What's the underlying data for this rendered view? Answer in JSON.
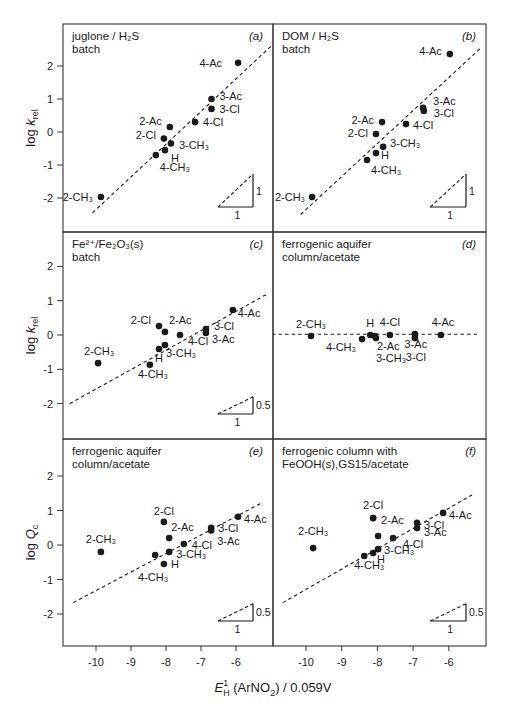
{
  "figure": {
    "x_axis_label": {
      "main": "E",
      "sup": "1",
      "sub": "H",
      "rest": " (ArNO",
      "sub2": "2",
      "tail": ") / 0.059V"
    },
    "x_ticks": [
      -10,
      -9,
      -8,
      -7,
      -6
    ],
    "y_ticks": [
      2,
      1,
      0,
      -1,
      -2
    ],
    "colors": {
      "ink": "#1a1a1a",
      "frame": "#333333",
      "background": "#ffffff"
    }
  },
  "chart_data": [
    {
      "id": "a",
      "panel_tag": "(a)",
      "type": "scatter",
      "title_lines": [
        "juglone / H₂S",
        "batch"
      ],
      "ylabel": "log k_rel",
      "xlabel": "",
      "xlim": [
        -10.95,
        -5.15
      ],
      "ylim": [
        -2.75,
        2.75
      ],
      "fit_line": {
        "x1": -10.1,
        "y1": -2.45,
        "x2": -5.0,
        "y2": 2.6
      },
      "slope_triangle": {
        "run": "1",
        "rise": "1"
      },
      "points": [
        {
          "label": "4-Ac",
          "x": -5.94,
          "y": 2.1,
          "lx": -14,
          "ly": 4,
          "anchor": "end"
        },
        {
          "label": "3-Ac",
          "x": -6.7,
          "y": 1.0,
          "lx": 6,
          "ly": 1,
          "anchor": "start"
        },
        {
          "label": "3-Cl",
          "x": -6.7,
          "y": 0.7,
          "lx": 6,
          "ly": 4,
          "anchor": "start"
        },
        {
          "label": "4-Cl",
          "x": -7.17,
          "y": 0.3,
          "lx": 6,
          "ly": 4,
          "anchor": "start"
        },
        {
          "label": "2-Ac",
          "x": -7.89,
          "y": 0.15,
          "lx": -6,
          "ly": -2,
          "anchor": "end"
        },
        {
          "label": "2-Cl",
          "x": -8.06,
          "y": -0.2,
          "lx": -6,
          "ly": 0,
          "anchor": "end"
        },
        {
          "label": "3-CH₃",
          "x": -7.86,
          "y": -0.35,
          "lx": 6,
          "ly": 5,
          "anchor": "start"
        },
        {
          "label": "H",
          "x": -8.03,
          "y": -0.55,
          "lx": 4,
          "ly": 12,
          "anchor": "start"
        },
        {
          "label": "4-CH₃",
          "x": -8.29,
          "y": -0.7,
          "lx": 2,
          "ly": 16,
          "anchor": "start"
        },
        {
          "label": "2-CH₃",
          "x": -9.86,
          "y": -1.97,
          "lx": -6,
          "ly": 4,
          "anchor": "end"
        }
      ]
    },
    {
      "id": "b",
      "panel_tag": "(b)",
      "type": "scatter",
      "title_lines": [
        "DOM / H₂S",
        "batch"
      ],
      "ylabel": "",
      "xlabel": "",
      "xlim": [
        -10.95,
        -5.15
      ],
      "ylim": [
        -2.75,
        2.75
      ],
      "fit_line": {
        "x1": -10.15,
        "y1": -2.5,
        "x2": -5.1,
        "y2": 2.55
      },
      "slope_triangle": {
        "run": "1",
        "rise": "1"
      },
      "points": [
        {
          "label": "4-Ac",
          "x": -5.97,
          "y": 2.36,
          "lx": -6,
          "ly": 1,
          "anchor": "end"
        },
        {
          "label": "3-Ac",
          "x": -6.72,
          "y": 0.73,
          "lx": 8,
          "ly": -3,
          "anchor": "start"
        },
        {
          "label": "3-Cl",
          "x": -6.7,
          "y": 0.64,
          "lx": 8,
          "ly": 6,
          "anchor": "start"
        },
        {
          "label": "4-Cl",
          "x": -7.2,
          "y": 0.24,
          "lx": 5,
          "ly": 5,
          "anchor": "start"
        },
        {
          "label": "2-Ac",
          "x": -7.87,
          "y": 0.3,
          "lx": -6,
          "ly": 2,
          "anchor": "end"
        },
        {
          "label": "2-Cl",
          "x": -8.04,
          "y": -0.06,
          "lx": -6,
          "ly": 3,
          "anchor": "end"
        },
        {
          "label": "3-CH₃",
          "x": -7.84,
          "y": -0.45,
          "lx": 5,
          "ly": 0,
          "anchor": "start"
        },
        {
          "label": "H",
          "x": -8.04,
          "y": -0.64,
          "lx": 3,
          "ly": 6,
          "anchor": "start"
        },
        {
          "label": "4-CH₃",
          "x": -8.29,
          "y": -0.85,
          "lx": 2,
          "ly": 14,
          "anchor": "start"
        },
        {
          "label": "2-CH₃",
          "x": -9.83,
          "y": -1.97,
          "lx": -5,
          "ly": 4,
          "anchor": "end"
        }
      ]
    },
    {
      "id": "c",
      "panel_tag": "(c)",
      "type": "scatter",
      "title_lines": [
        "Fe²⁺/Fe₂O₃(s)",
        "batch"
      ],
      "ylabel": "log k_rel",
      "xlabel": "",
      "xlim": [
        -10.95,
        -5.15
      ],
      "ylim": [
        -3.0,
        2.95
      ],
      "fit_line": {
        "x1": -10.75,
        "y1": -2.0,
        "x2": -5.1,
        "y2": 1.2
      },
      "slope_triangle": {
        "run": "1",
        "rise": "0.5"
      },
      "points": [
        {
          "label": "4-Ac",
          "x": -6.09,
          "y": 0.73,
          "lx": 3,
          "ly": 7,
          "anchor": "start"
        },
        {
          "label": "3-Cl",
          "x": -6.86,
          "y": 0.17,
          "lx": 6,
          "ly": 1,
          "anchor": "start"
        },
        {
          "label": "3-Ac",
          "x": -6.86,
          "y": 0.06,
          "lx": 4,
          "ly": 10,
          "anchor": "start"
        },
        {
          "label": "4-Cl",
          "x": -7.6,
          "y": 0.0,
          "lx": 6,
          "ly": 10,
          "anchor": "start"
        },
        {
          "label": "2-Ac",
          "x": -8.03,
          "y": 0.09,
          "lx": 2,
          "ly": -8,
          "anchor": "start"
        },
        {
          "label": "2-Cl",
          "x": -8.2,
          "y": 0.26,
          "lx": -6,
          "ly": -2,
          "anchor": "end"
        },
        {
          "label": "3-CH₃",
          "x": -8.03,
          "y": -0.29,
          "lx": -1,
          "ly": 12,
          "anchor": "start"
        },
        {
          "label": "H",
          "x": -8.2,
          "y": -0.41,
          "lx": 0,
          "ly": 13,
          "anchor": "middle"
        },
        {
          "label": "4-CH₃",
          "x": -8.46,
          "y": -0.87,
          "lx": -14,
          "ly": 13,
          "anchor": "start"
        },
        {
          "label": "2-CH₃",
          "x": -9.94,
          "y": -0.82,
          "lx": -16,
          "ly": -8,
          "anchor": "start"
        }
      ]
    },
    {
      "id": "d",
      "panel_tag": "(d)",
      "type": "scatter",
      "title_lines": [
        "ferrogenic aquifer",
        "column/acetate"
      ],
      "ylabel": "",
      "xlabel": "",
      "xlim": [
        -10.95,
        -5.15
      ],
      "ylim": [
        -3.0,
        2.95
      ],
      "fit_line": {
        "x1": -10.95,
        "y1": 0.02,
        "x2": -5.15,
        "y2": 0.02
      },
      "slope_triangle": null,
      "points": [
        {
          "label": "2-CH₃",
          "x": -9.86,
          "y": -0.03,
          "lx": 0,
          "ly": -8,
          "anchor": "middle"
        },
        {
          "label": "4-CH₃",
          "x": -8.43,
          "y": -0.12,
          "lx": -4,
          "ly": 12,
          "anchor": "end"
        },
        {
          "label": "H",
          "x": -8.2,
          "y": 0.0,
          "lx": 0,
          "ly": -8,
          "anchor": "middle"
        },
        {
          "label": "2-Ac",
          "x": -8.07,
          "y": -0.03,
          "lx": 0,
          "ly": 14,
          "anchor": "start"
        },
        {
          "label": "3-CH₃",
          "x": -8.04,
          "y": -0.09,
          "lx": -2,
          "ly": 24,
          "anchor": "start"
        },
        {
          "label": "4-Cl",
          "x": -7.65,
          "y": 0.0,
          "lx": 0,
          "ly": -9,
          "anchor": "middle"
        },
        {
          "label": "3-Ac",
          "x": -6.95,
          "y": 0.03,
          "lx": 1,
          "ly": 14,
          "anchor": "middle"
        },
        {
          "label": "3-Cl",
          "x": -6.95,
          "y": -0.09,
          "lx": 1,
          "ly": 23,
          "anchor": "middle"
        },
        {
          "label": "4-Ac",
          "x": -6.22,
          "y": 0.0,
          "lx": 2,
          "ly": -9,
          "anchor": "middle"
        }
      ]
    },
    {
      "id": "e",
      "panel_tag": "(e)",
      "type": "scatter",
      "title_lines": [
        "ferrogenic aquifer",
        "column/acetate"
      ],
      "ylabel": "log Q_c",
      "xlabel": "E_H^1 (ArNO2) / 0.059V",
      "xlim": [
        -10.95,
        -5.15
      ],
      "ylim": [
        -2.9,
        2.95
      ],
      "fit_line": {
        "x1": -10.65,
        "y1": -1.67,
        "x2": -5.25,
        "y2": 1.23
      },
      "slope_triangle": {
        "run": "1",
        "rise": "0.5"
      },
      "points": [
        {
          "label": "4-Ac",
          "x": -5.94,
          "y": 0.82,
          "lx": 4,
          "ly": 6,
          "anchor": "start"
        },
        {
          "label": "3-Cl",
          "x": -6.71,
          "y": 0.5,
          "lx": 5,
          "ly": 4,
          "anchor": "start"
        },
        {
          "label": "3-Ac",
          "x": -6.71,
          "y": 0.42,
          "lx": 4,
          "ly": 14,
          "anchor": "start"
        },
        {
          "label": "4-Cl",
          "x": -7.49,
          "y": 0.03,
          "lx": 6,
          "ly": 5,
          "anchor": "start"
        },
        {
          "label": "2-Ac",
          "x": -7.91,
          "y": 0.2,
          "lx": 0,
          "ly": -7,
          "anchor": "start"
        },
        {
          "label": "2-Cl",
          "x": -8.06,
          "y": 0.67,
          "lx": 0,
          "ly": -7,
          "anchor": "middle"
        },
        {
          "label": "3-CH₃",
          "x": -7.91,
          "y": -0.2,
          "lx": 5,
          "ly": 6,
          "anchor": "start"
        },
        {
          "label": "H",
          "x": -8.06,
          "y": -0.55,
          "lx": 5,
          "ly": 4,
          "anchor": "start"
        },
        {
          "label": "4-CH₃",
          "x": -8.31,
          "y": -0.29,
          "lx": -2,
          "ly": 26,
          "anchor": "middle"
        },
        {
          "label": "2-CH₃",
          "x": -9.86,
          "y": -0.2,
          "lx": 0,
          "ly": -9,
          "anchor": "middle"
        }
      ]
    },
    {
      "id": "f",
      "panel_tag": "(f)",
      "type": "scatter",
      "title_lines": [
        "ferrogenic column with",
        "FeOOH(s),GS15/acetate"
      ],
      "ylabel": "",
      "xlabel": "E_H^1 (ArNO2) / 0.059V",
      "xlim": [
        -10.95,
        -5.15
      ],
      "ylim": [
        -2.9,
        2.95
      ],
      "fit_line": {
        "x1": -10.65,
        "y1": -1.67,
        "x2": -5.35,
        "y2": 1.45
      },
      "slope_triangle": {
        "run": "1",
        "rise": "0.5"
      },
      "points": [
        {
          "label": "4-Ac",
          "x": -6.16,
          "y": 0.93,
          "lx": 4,
          "ly": 6,
          "anchor": "start"
        },
        {
          "label": "3-Cl",
          "x": -6.89,
          "y": 0.64,
          "lx": 5,
          "ly": 6,
          "anchor": "start"
        },
        {
          "label": "3-Ac",
          "x": -6.89,
          "y": 0.49,
          "lx": 5,
          "ly": 8,
          "anchor": "start"
        },
        {
          "label": "4-Cl",
          "x": -7.56,
          "y": 0.2,
          "lx": 8,
          "ly": 10,
          "anchor": "start"
        },
        {
          "label": "2-Ac",
          "x": -8.12,
          "y": 0.78,
          "lx": 6,
          "ly": 6,
          "anchor": "start"
        },
        {
          "label": "2-Cl",
          "x": -8.12,
          "y": 0.78,
          "lx": 0,
          "ly": -9,
          "anchor": "middle"
        },
        {
          "label": "",
          "x": -7.98,
          "y": 0.26,
          "lx": 0,
          "ly": 0,
          "anchor": "start"
        },
        {
          "label": "3-CH₃",
          "x": -7.98,
          "y": -0.12,
          "lx": 4,
          "ly": 5,
          "anchor": "start"
        },
        {
          "label": "H",
          "x": -8.12,
          "y": -0.23,
          "lx": 2,
          "ly": 10,
          "anchor": "start"
        },
        {
          "label": "4-CH₃",
          "x": -8.37,
          "y": -0.32,
          "lx": -12,
          "ly": 13,
          "anchor": "start"
        },
        {
          "label": "2-CH₃",
          "x": -9.8,
          "y": -0.09,
          "lx": 0,
          "ly": -13,
          "anchor": "middle"
        }
      ]
    }
  ]
}
